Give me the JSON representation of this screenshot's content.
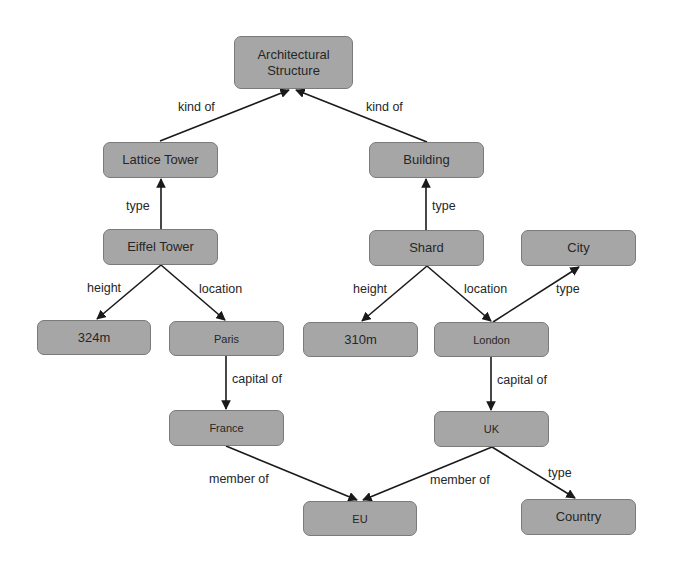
{
  "diagram": {
    "colors": {
      "node_fill": "#a6a6a6",
      "node_border": "#7a7a7a",
      "edge": "#1a1a1a",
      "text": "#262626",
      "background": "#ffffff"
    },
    "nodes": {
      "architectural_structure": {
        "label": "Architectural\nStructure"
      },
      "lattice_tower": {
        "label": "Lattice Tower"
      },
      "building": {
        "label": "Building"
      },
      "eiffel_tower": {
        "label": "Eiffel Tower"
      },
      "shard": {
        "label": "Shard"
      },
      "city": {
        "label": "City"
      },
      "height_324m": {
        "label": "324m"
      },
      "paris": {
        "label": "Paris"
      },
      "height_310m": {
        "label": "310m"
      },
      "london": {
        "label": "London"
      },
      "france": {
        "label": "France"
      },
      "uk": {
        "label": "UK"
      },
      "eu": {
        "label": "EU"
      },
      "country": {
        "label": "Country"
      }
    },
    "edges": {
      "lattice_kind_of": {
        "from": "Lattice Tower",
        "to": "Architectural Structure",
        "label": "kind of"
      },
      "building_kind_of": {
        "from": "Building",
        "to": "Architectural Structure",
        "label": "kind of"
      },
      "eiffel_type": {
        "from": "Eiffel Tower",
        "to": "Lattice Tower",
        "label": "type"
      },
      "shard_type": {
        "from": "Shard",
        "to": "Building",
        "label": "type"
      },
      "eiffel_height": {
        "from": "Eiffel Tower",
        "to": "324m",
        "label": "height"
      },
      "eiffel_location": {
        "from": "Eiffel Tower",
        "to": "Paris",
        "label": "location"
      },
      "shard_height": {
        "from": "Shard",
        "to": "310m",
        "label": "height"
      },
      "shard_location": {
        "from": "Shard",
        "to": "London",
        "label": "location"
      },
      "london_type": {
        "from": "London",
        "to": "City",
        "label": "type"
      },
      "paris_capital_of": {
        "from": "Paris",
        "to": "France",
        "label": "capital of"
      },
      "london_capital_of": {
        "from": "London",
        "to": "UK",
        "label": "capital of"
      },
      "france_member_of": {
        "from": "France",
        "to": "EU",
        "label": "member of"
      },
      "uk_member_of": {
        "from": "UK",
        "to": "EU",
        "label": "member of"
      },
      "uk_type": {
        "from": "UK",
        "to": "Country",
        "label": "type"
      }
    }
  }
}
